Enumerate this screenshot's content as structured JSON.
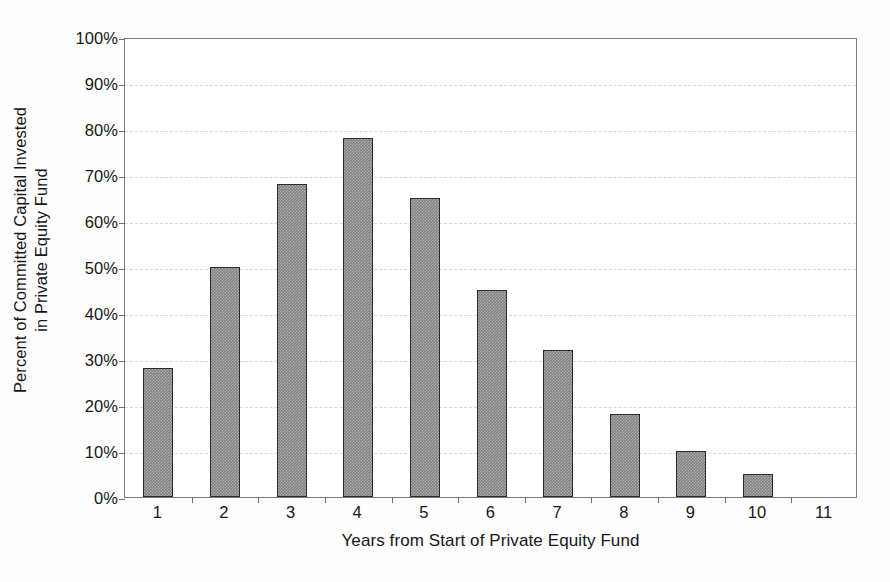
{
  "chart_data": {
    "type": "bar",
    "title": "",
    "subtitle": "",
    "xlabel": "Years from Start of Private Equity Fund",
    "ylabel_line1": "Percent of Committed Capital Invested",
    "ylabel_line2": "in Private Equity Fund",
    "categories": [
      "1",
      "2",
      "3",
      "4",
      "5",
      "6",
      "7",
      "8",
      "9",
      "10",
      "11"
    ],
    "values": [
      28,
      50,
      68,
      78,
      65,
      45,
      32,
      18,
      10,
      5,
      null
    ],
    "value_labels": [
      "28%",
      "50%",
      "68%",
      "78%",
      "65%",
      "45%",
      "32%",
      "18%",
      "10%",
      "5%",
      ""
    ],
    "ylim": [
      0,
      100
    ],
    "ytick_values": [
      0,
      10,
      20,
      30,
      40,
      50,
      60,
      70,
      80,
      90,
      100
    ],
    "ytick_labels": [
      "0%",
      "10%",
      "20%",
      "30%",
      "40%",
      "50%",
      "60%",
      "70%",
      "80%",
      "90%",
      "100%"
    ],
    "grid": true,
    "grid_axis": "y",
    "legend": false,
    "legend_position": "none",
    "bar_color": "#808080",
    "bar_edge_color": "#2b2b2b",
    "grid_color": "#d8d8d8",
    "axis_color": "#7c7c7c",
    "text_color": "#161616",
    "background_color": "#ffffff"
  }
}
